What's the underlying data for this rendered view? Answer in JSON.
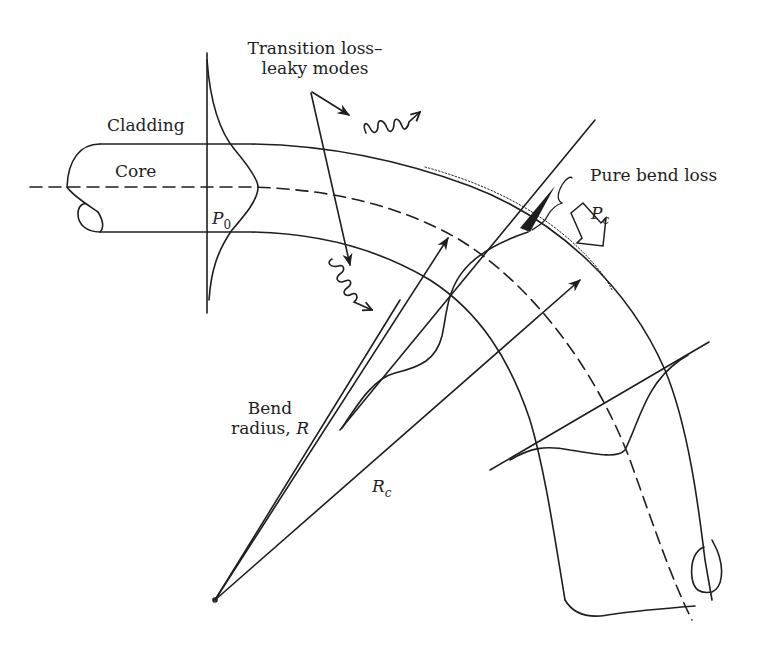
{
  "figure": {
    "type": "optical fiber bend loss diagram",
    "stroke_color": "#1e1e1e",
    "background": "#ffffff"
  },
  "labels": {
    "transition_loss_line1": "Transition loss–",
    "transition_loss_line2": "leaky modes",
    "cladding": "Cladding",
    "core": "Core",
    "p0_symbol": "P",
    "p0_sub": "0",
    "pure_bend_loss": "Pure bend loss",
    "pc_symbol": "P",
    "pc_sub": "c",
    "bend_radius_line1": "Bend",
    "bend_radius_line2": "radius, ",
    "bend_radius_symbol": "R",
    "rc_symbol": "R",
    "rc_sub": "c"
  },
  "elements": {
    "fiber": [
      "cladding-outer-boundary",
      "core-axis-dashed",
      "cladding-inner-boundary",
      "fiber-left-end",
      "fiber-right-end"
    ],
    "profiles": [
      "straight-section-mode-profile",
      "bend-section-mode-profile",
      "exit-section-mode-profile"
    ],
    "arrows": [
      "transition-loss-pointer-1",
      "transition-loss-pointer-2",
      "radiated-wave-top",
      "radiated-wave-bottom",
      "radius-arrow-R",
      "radius-arrow-Rc",
      "power-loss-arrow-Pc"
    ],
    "markers": [
      "bend-center-point",
      "caustic-dotted-line",
      "pure-bend-loss-brace",
      "radiated-tail-shaded"
    ]
  }
}
